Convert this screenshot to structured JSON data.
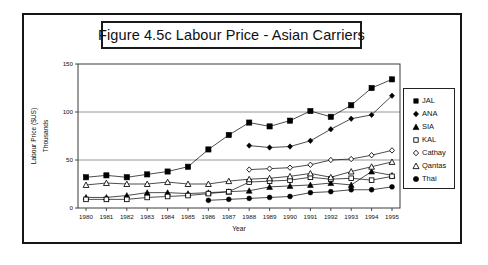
{
  "figure": {
    "title": "Figure 4.5c  Labour Price - Asian Carriers",
    "frame_color": "#151515",
    "background": "#ffffff"
  },
  "legend": {
    "position": "right-outside",
    "entries": [
      {
        "label": "JAL",
        "marker": "filled-square-icon"
      },
      {
        "label": "ANA",
        "marker": "filled-diamond-icon"
      },
      {
        "label": "SIA",
        "marker": "filled-triangle-icon"
      },
      {
        "label": "KAL",
        "marker": "open-square-icon"
      },
      {
        "label": "Cathay",
        "marker": "open-diamond-icon"
      },
      {
        "label": "Qantas",
        "marker": "open-triangle-icon"
      },
      {
        "label": "Thai",
        "marker": "filled-circle-icon"
      }
    ]
  },
  "chart_data": {
    "type": "line",
    "title": "Figure 4.5c  Labour Price - Asian Carriers",
    "xlabel": "Year",
    "ylabel": "Labour Price ($US)",
    "ylabel2": "Thousands",
    "categories": [
      1980,
      1981,
      1982,
      1983,
      1984,
      1985,
      1986,
      1987,
      1988,
      1989,
      1990,
      1991,
      1992,
      1993,
      1994,
      1995
    ],
    "xticklabels": [
      "1980",
      "1981",
      "1982",
      "1983",
      "1984",
      "1985",
      "1986",
      "1987",
      "1988",
      "1989",
      "1990",
      "1991",
      "1992",
      "1993",
      "1994",
      "1995"
    ],
    "yticks": [
      0,
      50,
      100,
      150
    ],
    "yticklabels": [
      "0",
      "50",
      "100",
      "150"
    ],
    "ylim": [
      0,
      150
    ],
    "grid": "horizontal-major",
    "series": [
      {
        "name": "JAL",
        "marker": "filled-square",
        "color": "#000000",
        "values": [
          32,
          34,
          32,
          35,
          38,
          43,
          61,
          76,
          89,
          85,
          91,
          101,
          95,
          107,
          125,
          134
        ]
      },
      {
        "name": "ANA",
        "marker": "filled-diamond",
        "color": "#000000",
        "values": [
          null,
          null,
          null,
          null,
          null,
          null,
          null,
          null,
          65,
          63,
          64,
          70,
          82,
          93,
          97,
          117
        ]
      },
      {
        "name": "SIA",
        "marker": "filled-triangle",
        "color": "#000000",
        "values": [
          11,
          11,
          13,
          16,
          16,
          15,
          16,
          17,
          18,
          22,
          23,
          24,
          26,
          24,
          38,
          34
        ]
      },
      {
        "name": "KAL",
        "marker": "open-square",
        "color": "#000000",
        "values": [
          9,
          9,
          9,
          11,
          12,
          13,
          15,
          17,
          27,
          28,
          29,
          32,
          30,
          31,
          29,
          33
        ]
      },
      {
        "name": "Cathay",
        "marker": "open-diamond",
        "color": "#000000",
        "values": [
          null,
          null,
          null,
          null,
          null,
          null,
          null,
          null,
          40,
          41,
          42,
          45,
          50,
          51,
          55,
          60
        ]
      },
      {
        "name": "Qantas",
        "marker": "open-triangle",
        "color": "#000000",
        "values": [
          24,
          26,
          25,
          25,
          27,
          25,
          25,
          28,
          30,
          31,
          33,
          36,
          32,
          38,
          43,
          48
        ]
      },
      {
        "name": "Thai",
        "marker": "filled-circle",
        "color": "#000000",
        "values": [
          null,
          null,
          null,
          null,
          null,
          null,
          8,
          9,
          10,
          11,
          12,
          16,
          17,
          19,
          19,
          22
        ]
      }
    ]
  }
}
